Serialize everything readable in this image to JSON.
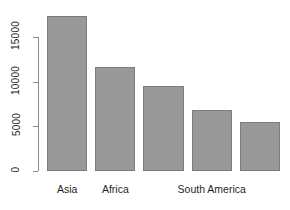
{
  "chart_data": {
    "type": "bar",
    "title": "",
    "subtitle": "",
    "xlabel": "",
    "ylabel": "",
    "categories": [
      "Asia",
      "Africa",
      "Europe",
      "North America",
      "South America"
    ],
    "visible_tick_labels": [
      "Asia",
      "Africa",
      "",
      "South America",
      ""
    ],
    "values": [
      17400,
      11600,
      9500,
      6800,
      5500
    ],
    "ylim": [
      0,
      17400
    ],
    "yticks": [
      0,
      5000,
      10000,
      15000
    ],
    "ytick_labels": [
      "0",
      "5000",
      "10000",
      "15000"
    ],
    "grid": false,
    "legend": false,
    "bar_fill_color": "#999999",
    "bar_border_color": "#7d7d7d",
    "axis_color": "#8c8c8c",
    "background_color": "#ffffff"
  },
  "axis": {
    "y_label_rotation": "90",
    "tick_style": "outward",
    "x_axis_visible": "false"
  }
}
